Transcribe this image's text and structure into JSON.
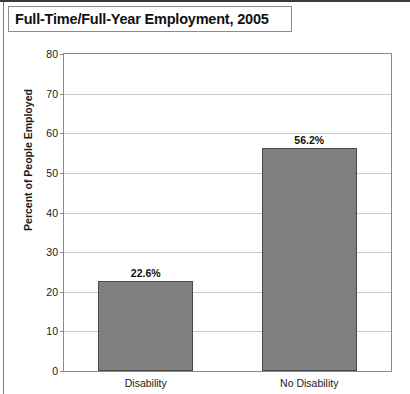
{
  "figure": {
    "title": "Full-Time/Full-Year Employment, 2005"
  },
  "chart_data": {
    "type": "bar",
    "title": "Full-Time/Full-Year Employment, 2005",
    "xlabel": "",
    "ylabel": "Percent of People Employed",
    "categories": [
      "Disability",
      "No Disability"
    ],
    "values": [
      22.6,
      56.2
    ],
    "value_labels": [
      "22.6%",
      "56.2%"
    ],
    "ylim": [
      0,
      80
    ],
    "ytick_labels": [
      "0",
      "10",
      "20",
      "30",
      "40",
      "50",
      "60",
      "70",
      "80"
    ],
    "ytick_values": [
      0,
      10,
      20,
      30,
      40,
      50,
      60,
      70,
      80
    ],
    "grid": "horizontal",
    "legend": "none",
    "bar_color": "#808080",
    "bar_border_color": "#4a4a4a",
    "gridline_color": "#c9c9c9",
    "axis_color": "#8a8a8a",
    "background": "#ffffff"
  }
}
